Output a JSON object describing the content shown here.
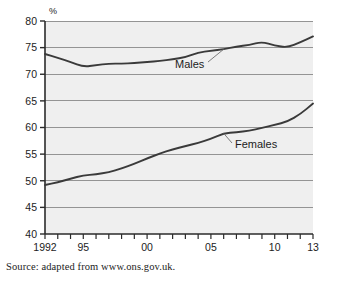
{
  "chart_data": {
    "type": "line",
    "title": "",
    "subtitle": "",
    "xlabel": "",
    "ylabel": "%",
    "ylim": [
      40,
      80
    ],
    "xlim": [
      1992,
      2013
    ],
    "yticks": [
      40,
      45,
      50,
      55,
      60,
      65,
      70,
      75,
      80
    ],
    "ytick_labels": [
      "40",
      "45",
      "50",
      "55",
      "60",
      "65",
      "70",
      "75",
      "80"
    ],
    "xticks": [
      1992,
      1993,
      1994,
      1995,
      1996,
      1997,
      1998,
      1999,
      2000,
      2001,
      2002,
      2003,
      2004,
      2005,
      2006,
      2007,
      2008,
      2009,
      2010,
      2011,
      2012,
      2013
    ],
    "xtick_labels": [
      "1992",
      "",
      "",
      "95",
      "",
      "",
      "",
      "",
      "00",
      "",
      "",
      "",
      "",
      "05",
      "",
      "",
      "",
      "",
      "10",
      "",
      "",
      "13"
    ],
    "labeled_xticks": [
      {
        "x": 1992,
        "label": "1992"
      },
      {
        "x": 1995,
        "label": "95"
      },
      {
        "x": 2000,
        "label": "00"
      },
      {
        "x": 2005,
        "label": "05"
      },
      {
        "x": 2010,
        "label": "10"
      },
      {
        "x": 2013,
        "label": "13"
      }
    ],
    "grid": true,
    "grid_axis": "y",
    "legend_position": "inline-annotation",
    "x": [
      1992,
      1993,
      1994,
      1995,
      1996,
      1997,
      1998,
      1999,
      2000,
      2001,
      2002,
      2003,
      2004,
      2005,
      2006,
      2007,
      2008,
      2009,
      2010,
      2011,
      2012,
      2013
    ],
    "series": [
      {
        "name": "Males",
        "annotation": "Males",
        "color": "#3a3a3a",
        "values": [
          73.8,
          73.1,
          72.3,
          71.4,
          71.7,
          72.0,
          72.0,
          72.1,
          72.3,
          72.5,
          72.8,
          73.2,
          74.1,
          74.4,
          74.7,
          75.2,
          75.5,
          76.1,
          75.4,
          75.0,
          76.0,
          77.1
        ]
      },
      {
        "name": "Females",
        "annotation": "Females",
        "color": "#3a3a3a",
        "values": [
          49.2,
          49.7,
          50.4,
          51.0,
          51.2,
          51.6,
          52.3,
          53.2,
          54.2,
          55.1,
          55.9,
          56.5,
          57.1,
          57.9,
          58.9,
          59.1,
          59.4,
          59.9,
          60.5,
          61.1,
          62.5,
          64.5
        ]
      }
    ],
    "annotations": [
      {
        "text": "Males",
        "series": "Males",
        "anchor_x": 2006,
        "anchor_y": 74.7
      },
      {
        "text": "Females",
        "series": "Females",
        "anchor_x": 2006,
        "anchor_y": 58.9
      }
    ]
  },
  "source": {
    "note": "Source: adapted from www.ons.gov.uk."
  },
  "colors": {
    "plot_background": "#efefef",
    "gridline": "#8a8a8a",
    "axis": "#2b2b2b",
    "line": "#3a3a3a",
    "page_background": "#ffffff",
    "text": "#1c1c1c"
  }
}
